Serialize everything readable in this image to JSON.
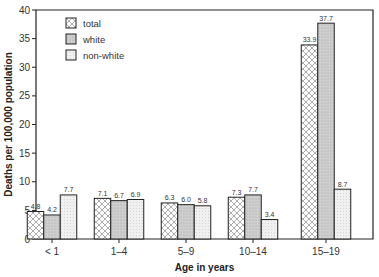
{
  "chart_data": {
    "type": "bar",
    "title": "",
    "xlabel": "Age in years",
    "ylabel": "Deaths per 100,000 population",
    "ylim": [
      0,
      40
    ],
    "yticks": [
      0,
      5,
      10,
      15,
      20,
      25,
      30,
      35,
      40
    ],
    "grid": false,
    "legend_position": "upper-left",
    "categories": [
      "< 1",
      "1–4",
      "5–9",
      "10–14",
      "15–19"
    ],
    "series": [
      {
        "name": "total",
        "pattern": "crosshatch",
        "values": [
          4.8,
          7.1,
          6.3,
          7.3,
          33.9
        ]
      },
      {
        "name": "white",
        "pattern": "dark-stipple",
        "values": [
          4.2,
          6.7,
          6.0,
          7.7,
          37.7
        ]
      },
      {
        "name": "non-white",
        "pattern": "light-stipple",
        "values": [
          7.7,
          6.9,
          5.8,
          3.4,
          8.7
        ]
      }
    ],
    "value_labels": [
      [
        "4.8",
        "4.2",
        "7.7"
      ],
      [
        "7.1",
        "6.7",
        "6.9"
      ],
      [
        "6.3",
        "6.0",
        "5.8"
      ],
      [
        "7.3",
        "7.7",
        "3.4"
      ],
      [
        "33.9",
        "37.7",
        "8.7"
      ]
    ]
  },
  "colors": {
    "frame": "#222222",
    "white_fill": "#cfcfcf",
    "nonwhite_fill": "#ececec",
    "total_fill": "#ffffff"
  }
}
